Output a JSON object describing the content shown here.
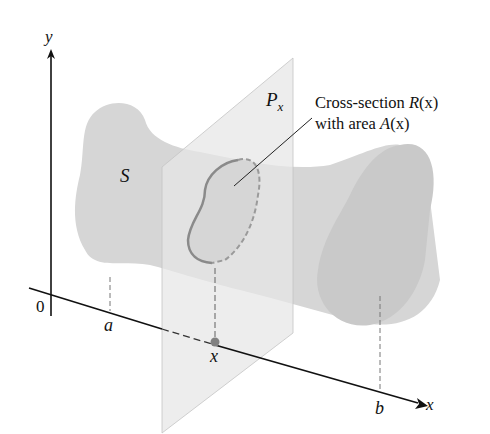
{
  "figure": {
    "type": "volume-by-cross-section diagram",
    "axes": {
      "y_label": "y",
      "x_label": "x",
      "origin_label": "0"
    },
    "solid_label": "S",
    "plane_label_main": "P",
    "plane_label_sub": "x",
    "tick_labels": {
      "a": "a",
      "x": "x",
      "b": "b"
    },
    "annotation": {
      "line1_prefix": "Cross-section ",
      "line1_func": "R",
      "line1_arg": "(x)",
      "line2_prefix": "with area ",
      "line2_func": "A",
      "line2_arg": "(x)"
    },
    "colors": {
      "solid": "#d6d6d6",
      "solid_end": "#c8c8c8",
      "plane": "#e4e4e4",
      "cross_section_curve": "#8a8a8a",
      "point": "#808080",
      "axis": "#111111"
    }
  }
}
